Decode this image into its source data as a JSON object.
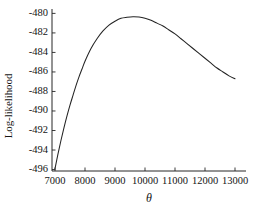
{
  "chart_data": {
    "type": "line",
    "title": "",
    "xlabel": "θ",
    "ylabel": "Log-likelihood",
    "xlim": [
      7000,
      13000
    ],
    "ylim": [
      -496,
      -479.6
    ],
    "grid": false,
    "legend": "none",
    "line_color": "#232323",
    "xticks": [
      7000,
      8000,
      9000,
      10000,
      11000,
      12000,
      13000
    ],
    "xticklabels": [
      "7000",
      "8000",
      "9000",
      "10000",
      "11000",
      "12000",
      "13000"
    ],
    "yticks": [
      -480,
      -482,
      -484,
      -486,
      -488,
      -490,
      -492,
      -494,
      -496
    ],
    "yticklabels": [
      "-480",
      "-482",
      "-484",
      "-486",
      "-488",
      "-490",
      "-492",
      "-494",
      "-496"
    ],
    "series": [
      {
        "name": "Profile log-likelihood",
        "x": [
          7000,
          7100,
          7200,
          7300,
          7400,
          7500,
          7600,
          7700,
          7800,
          7900,
          8000,
          8200,
          8400,
          8600,
          8800,
          9000,
          9200,
          9400,
          9600,
          9800,
          10000,
          10200,
          10400,
          10600,
          10800,
          11000,
          11200,
          11400,
          11600,
          11800,
          12000,
          12200,
          12400,
          12600,
          12800,
          13000
        ],
        "y": [
          -495.9,
          -494.4,
          -493.0,
          -491.7,
          -490.5,
          -489.4,
          -488.4,
          -487.4,
          -486.5,
          -485.7,
          -484.9,
          -483.6,
          -482.6,
          -481.8,
          -481.2,
          -480.8,
          -480.5,
          -480.4,
          -480.35,
          -480.38,
          -480.5,
          -480.7,
          -481.0,
          -481.3,
          -481.7,
          -482.1,
          -482.6,
          -483.1,
          -483.6,
          -484.1,
          -484.6,
          -485.1,
          -485.6,
          -486.0,
          -486.4,
          -486.7
        ]
      }
    ]
  }
}
